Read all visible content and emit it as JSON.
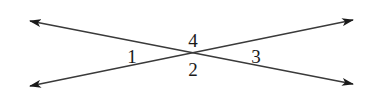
{
  "diagram": {
    "colors": {
      "line": "#3a3a3a",
      "arrow": "#1a1a1a",
      "text": "#1a1a1a",
      "background": "#ffffff"
    },
    "intersection": {
      "x": 190,
      "y": 53
    },
    "lines": [
      {
        "id": "line-a",
        "from": {
          "x": 30,
          "y": 21
        },
        "to": {
          "x": 353,
          "y": 84
        }
      },
      {
        "id": "line-b",
        "from": {
          "x": 30,
          "y": 86
        },
        "to": {
          "x": 353,
          "y": 20
        }
      }
    ],
    "angles": [
      {
        "label": "1",
        "x": 132,
        "y": 63
      },
      {
        "label": "4",
        "x": 193,
        "y": 47
      },
      {
        "label": "2",
        "x": 193,
        "y": 76
      },
      {
        "label": "3",
        "x": 256,
        "y": 63
      }
    ]
  }
}
